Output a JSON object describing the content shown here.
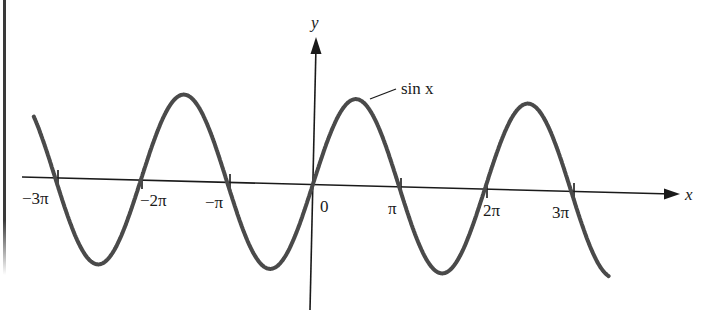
{
  "chart_data": {
    "type": "line",
    "title": "",
    "xlabel": "x",
    "ylabel": "y",
    "series": [
      {
        "name": "sin x",
        "function": "sin(x)",
        "x_range": [
          -10.2,
          10.8
        ]
      }
    ],
    "x_ticks": [
      {
        "value": -9.4248,
        "label": "−3π"
      },
      {
        "value": -6.2832,
        "label": "−2π"
      },
      {
        "value": -3.1416,
        "label": "−π"
      },
      {
        "value": 0,
        "label": "0"
      },
      {
        "value": 3.1416,
        "label": "π"
      },
      {
        "value": 6.2832,
        "label": "2π"
      },
      {
        "value": 9.4248,
        "label": "3π"
      }
    ],
    "zeros": [
      -9.4248,
      -6.2832,
      -3.1416,
      0,
      3.1416,
      6.2832,
      9.4248
    ],
    "peaks": [
      {
        "x": -4.7124,
        "y": 1
      },
      {
        "x": 1.5708,
        "y": 1
      },
      {
        "x": 7.854,
        "y": 1
      }
    ],
    "troughs": [
      {
        "x": -7.854,
        "y": -1
      },
      {
        "x": -1.5708,
        "y": -1
      },
      {
        "x": 4.7124,
        "y": -1
      }
    ],
    "ylim": [
      -1.2,
      1.2
    ],
    "grid": false,
    "legend": "none",
    "annotations": [
      {
        "text": "sin x",
        "points_to": "curve near x = π/2"
      }
    ]
  },
  "figure": {
    "axis_labels": {
      "x": "x",
      "y": "y"
    },
    "curve_label": "sin x",
    "tick_labels": {
      "neg3pi": "−3π",
      "neg2pi": "−2π",
      "negpi": "−π",
      "zero": "0",
      "pi": "π",
      "twopi": "2π",
      "threepi": "3π"
    },
    "colors": {
      "curve": "#4a4a4a",
      "axes": "#1a1a1a",
      "background": "#ffffff"
    }
  }
}
